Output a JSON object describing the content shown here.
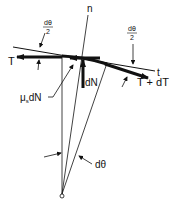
{
  "diagram": {
    "labels": {
      "normal_axis": "n",
      "tangent_axis": "t",
      "tension_left": "T",
      "tension_right": "T + dT",
      "normal_force": "dN",
      "friction_mu": "μ",
      "friction_sub": "s",
      "friction_rest": "dN",
      "half_angle_num": "dθ",
      "half_angle_den": "2",
      "half_angle_num_right": "dθ",
      "half_angle_den_right": "2",
      "angle": "dθ"
    },
    "colors": {
      "ink": "#111111",
      "background": "#ffffff"
    }
  }
}
